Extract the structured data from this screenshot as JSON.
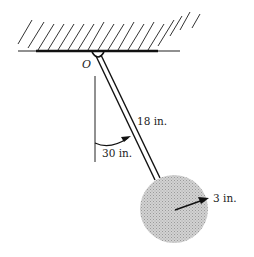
{
  "figure": {
    "type": "pendulum-diagram",
    "pivot_label": "O",
    "rod_length_label": "18 in.",
    "angle_label": "30 in.",
    "disc_radius_label": "3 in.",
    "colors": {
      "ink": "#1a1a1a",
      "disc_fill": "#c8c8c8",
      "hatch": "#333333"
    }
  }
}
